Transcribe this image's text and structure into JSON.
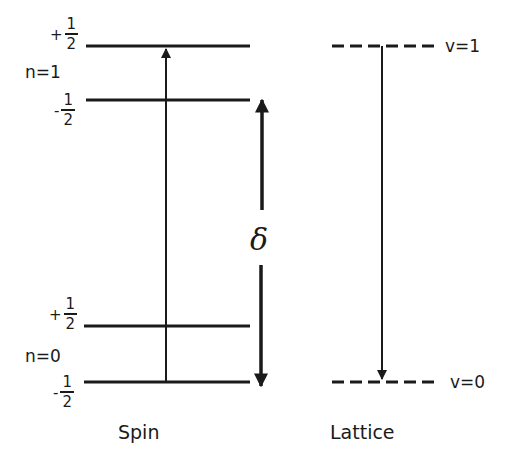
{
  "diagram": {
    "spin": {
      "title": "Spin",
      "levels": [
        {
          "n_label": "n=1",
          "sublevels": [
            {
              "sign": "+",
              "num": "1",
              "den": "2"
            },
            {
              "sign": "-",
              "num": "1",
              "den": "2"
            }
          ]
        },
        {
          "n_label": "n=0",
          "sublevels": [
            {
              "sign": "+",
              "num": "1",
              "den": "2"
            },
            {
              "sign": "-",
              "num": "1",
              "den": "2"
            }
          ]
        }
      ],
      "transition": "upward arrow from n=0,-1/2 to n=1,+1/2"
    },
    "splitting": {
      "symbol": "δ",
      "description": "double-headed arrow between n=1,-1/2 and n=0,-1/2"
    },
    "lattice": {
      "title": "Lattice",
      "levels": [
        {
          "label": "v=1"
        },
        {
          "label": "v=0"
        }
      ],
      "transition": "downward arrow from v=1 to v=0"
    },
    "colors": {
      "ink": "#1a1a1a",
      "background": "#ffffff"
    }
  }
}
